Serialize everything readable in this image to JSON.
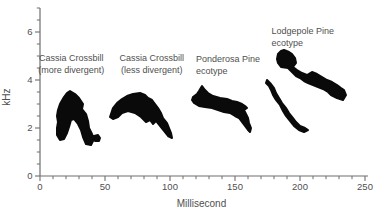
{
  "figure": {
    "colors": {
      "ink": "#0a0a0a",
      "text": "#4f4f4f",
      "axis": "#6e6e6e",
      "background": "#ffffff"
    }
  },
  "chart_data": {
    "type": "area",
    "subtype": "spectrogram-silhouettes",
    "title": "",
    "xlabel": "Millisecond",
    "ylabel": "kHz",
    "xlim": [
      0,
      250
    ],
    "ylim": [
      0,
      7
    ],
    "x_major_ticks": [
      0,
      50,
      100,
      150,
      200,
      250
    ],
    "x_minor_step": 10,
    "y_major_ticks": [
      0,
      2,
      4,
      6
    ],
    "y_minor_step": 0.5,
    "grid": false,
    "legend": "none",
    "calls": [
      {
        "id": "cassia-crossbill-more-divergent",
        "label_lines": [
          "Cassia Crossbill",
          "(more divergent)"
        ],
        "label_anchor": {
          "ms": 24,
          "khz": 4.8,
          "align": "middle"
        },
        "time_range_ms": [
          12,
          46
        ],
        "freq_range_khz": [
          1.3,
          3.5
        ],
        "path": "M70,91 L75,94 L79,98 L83,104 L82,109 L86,114 L88,121 L89,128 L92,134 L94,139 L91,145 L86,144 L83,137 L81,130 L78,124 L74,119 L71,120 L69,127 L67,133 L64,139 L60,140 L57,135 L57,128 L58,122 L57,116 L58,110 L60,104 L64,97 L67,93 Z M94,136 L98,135 L100,138 L99,141 L95,141 L93,138 Z"
      },
      {
        "id": "cassia-crossbill-less-divergent",
        "label_lines": [
          "Cassia Crossbill",
          "(less divergent)"
        ],
        "label_anchor": {
          "ms": 86,
          "khz": 4.8,
          "align": "middle"
        },
        "time_range_ms": [
          54,
          101
        ],
        "freq_range_khz": [
          1.6,
          3.5
        ],
        "path": "M111,114 L113,108 L117,103 L122,99 L127,96 L133,94 L140,93 L145,95 L148,98 L152,100 L155,104 L158,108 L161,113 L163,118 L167,123 L169,128 L171,133 L172,138 L168,136 L164,131 L160,126 L156,121 L153,124 L150,120 L146,122 L141,117 L135,113 L128,111 L122,113 L118,117 L113,119 L110,117 Z"
      },
      {
        "id": "ponderosa-pine-ecotype",
        "label_lines": [
          "Ponderosa Pine",
          "ecotype"
        ],
        "label_anchor": {
          "ms": 120,
          "khz": 4.75,
          "align": "start"
        },
        "time_range_ms": [
          117,
          162
        ],
        "freq_range_khz": [
          1.8,
          3.8
        ],
        "path": "M202,86 L205,90 L208,93 L213,96 L220,98 L227,99 L232,101 L237,102 L242,104 L245,106 L247,108 L244,110 L246,114 L248,118 L249,123 L251,128 L250,132 L248,130 L245,126 L242,122 L239,118 L235,116 L230,113 L224,112 L218,110 L212,108 L205,107 L199,106 L194,103 L192,100 L193,97 L197,94 L199,91 Z"
      },
      {
        "id": "lodgepole-pine-ecotype",
        "label_lines": [
          "Lodgepole Pine",
          "ecotype"
        ],
        "label_anchor": {
          "ms": 178,
          "khz": 5.9,
          "align": "start"
        },
        "time_range_ms": [
          173,
          232
        ],
        "freq_range_khz": [
          1.9,
          5.3
        ],
        "path": "M284,50 L289,52 L292,54 L295,58 L296,63 L293,67 L297,70 L302,73 L307,75 L312,72 L317,74 L322,77 L327,80 L332,82 L337,85 L341,88 L344,90 L346,95 L343,100 L337,98 L331,95 L328,92 L323,89 L318,87 L313,85 L308,83 L304,81 L300,78 L296,76 L292,72 L288,68 L281,67 L278,63 L277,59 L278,54 L281,51 Z M267,80 L271,84 L274,88 L276,93 L279,98 L282,103 L286,108 L289,113 L293,118 L296,122 L300,126 L305,128 L308,130 L304,132 L299,130 L294,126 L290,121 L286,116 L283,111 L280,105 L276,100 L273,95 L271,90 L269,86 L266,83 Z"
      }
    ]
  }
}
